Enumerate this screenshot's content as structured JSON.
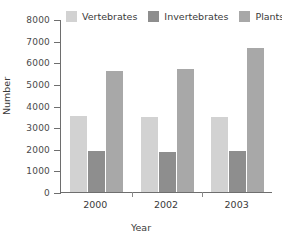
{
  "chart_data": {
    "type": "bar",
    "title": "",
    "xlabel": "Year",
    "ylabel": "Number",
    "categories": [
      "2000",
      "2002",
      "2003"
    ],
    "series": [
      {
        "name": "Vertebrates",
        "color": "#d2d2d2",
        "values": [
          3500,
          3450,
          3450
        ]
      },
      {
        "name": "Invertebrates",
        "color": "#8e8e8e",
        "values": [
          1900,
          1850,
          1900
        ]
      },
      {
        "name": "Plants",
        "color": "#a8a8a8",
        "values": [
          5600,
          5700,
          6650
        ]
      }
    ],
    "ylim": [
      0,
      8000
    ],
    "ytick_values": [
      8000,
      7000,
      6000,
      5000,
      4000,
      3000,
      2000,
      1000,
      0
    ],
    "ytick_labels": [
      "8000",
      "7000",
      "6000",
      "5000",
      "4000",
      "3000",
      "2000",
      "1000",
      "0"
    ],
    "grid": false,
    "legend_position": "top"
  },
  "axes": {
    "y_title": "Number",
    "x_title": "Year"
  },
  "legend": {
    "items": [
      {
        "label": "Vertebrates",
        "color": "#d2d2d2"
      },
      {
        "label": "Invertebrates",
        "color": "#8e8e8e"
      },
      {
        "label": "Plants",
        "color": "#a8a8a8"
      }
    ]
  }
}
